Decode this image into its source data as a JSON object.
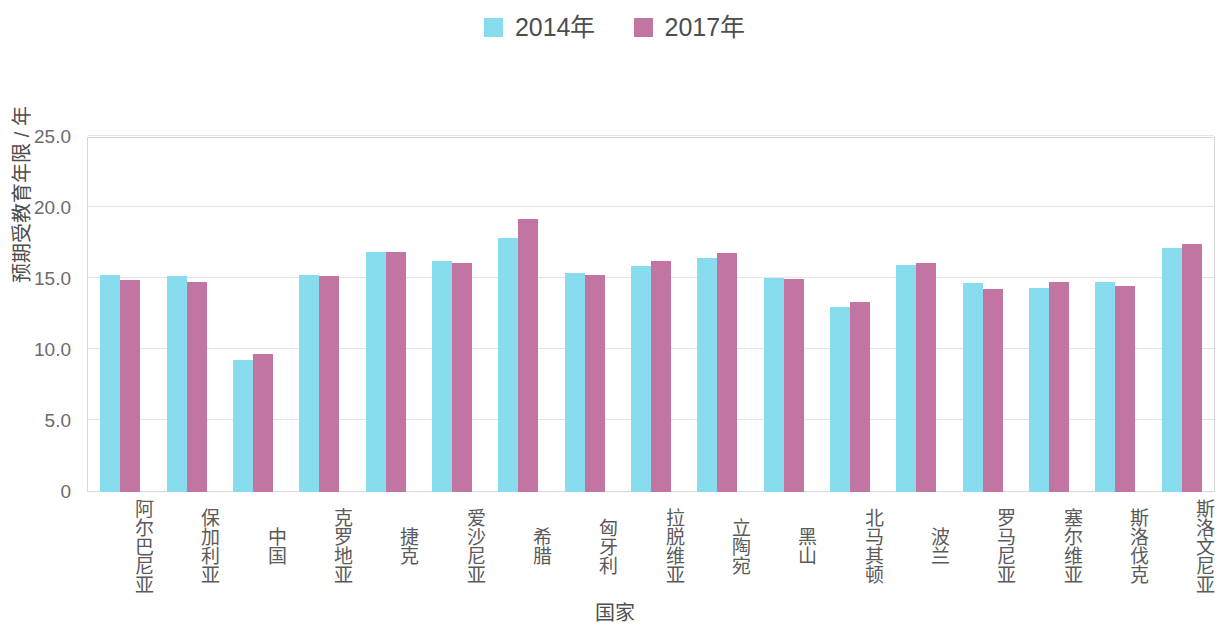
{
  "legend": {
    "position": "top-center",
    "entries": [
      {
        "label": "2014年",
        "color": "#87dcee",
        "swatch_name": "legend-swatch-2014"
      },
      {
        "label": "2017年",
        "color": "#c274a2",
        "swatch_name": "legend-swatch-2017"
      }
    ]
  },
  "axes": {
    "y_title": "预期受教育年限 / 年",
    "x_title": "国家",
    "y_ticks": [
      "0",
      "5.0",
      "10.0",
      "15.0",
      "20.0",
      "25.0"
    ]
  },
  "chart_data": {
    "type": "bar",
    "title": "",
    "subtitle": "",
    "xlabel": "国家",
    "ylabel": "预期受教育年限 / 年",
    "ylim": [
      0,
      25
    ],
    "yticks": [
      0,
      5,
      10,
      15,
      20,
      25
    ],
    "ytick_labels": [
      "0",
      "5.0",
      "10.0",
      "15.0",
      "20.0",
      "25.0"
    ],
    "grid": true,
    "legend_position": "top-center",
    "categories": [
      "阿尔巴尼亚",
      "保加利亚",
      "中国",
      "克罗地亚",
      "捷克",
      "爱沙尼亚",
      "希腊",
      "匈牙利",
      "拉脱维亚",
      "立陶宛",
      "黑山",
      "北马其顿",
      "波兰",
      "罗马尼亚",
      "塞尔维亚",
      "斯洛伐克",
      "斯洛文尼亚"
    ],
    "series": [
      {
        "name": "2014年",
        "color": "#87dcee",
        "values": [
          15.3,
          15.2,
          9.3,
          15.3,
          16.9,
          16.3,
          17.9,
          15.4,
          15.9,
          16.5,
          15.1,
          13.0,
          16.0,
          14.7,
          14.4,
          14.8,
          17.2
        ]
      },
      {
        "name": "2017年",
        "color": "#c274a2",
        "values": [
          14.9,
          14.8,
          9.7,
          15.2,
          16.9,
          16.1,
          19.2,
          15.3,
          16.3,
          16.8,
          15.0,
          13.4,
          16.1,
          14.3,
          14.8,
          14.5,
          17.5
        ]
      }
    ]
  }
}
